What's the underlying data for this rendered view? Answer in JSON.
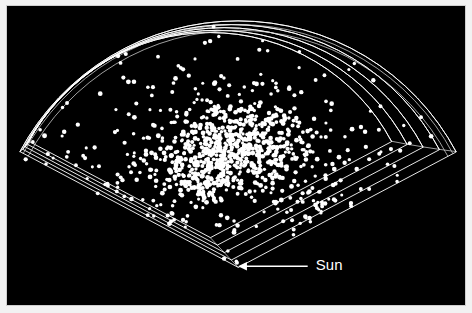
{
  "figure": {
    "kind": "redshift-survey-wedge-diagram",
    "background_color": "#000000",
    "page_background_color": "#f2f2f2",
    "border_color": "#cfcfcf",
    "ink_color": "#ffffff"
  },
  "annotation": {
    "label": "Sun",
    "arrow_direction": "left",
    "arrow_tip_x": 232,
    "arrow_tail_x": 302,
    "arrow_y": 262,
    "label_x": 310,
    "label_y": 262
  },
  "chart_data": {
    "type": "scatter",
    "title": "",
    "subtitle": "",
    "xlabel": "",
    "ylabel": "",
    "annotations": [
      "Sun"
    ],
    "legend": [],
    "grid": false,
    "projection": "polar-wedge",
    "geometry": {
      "apex": [
        232,
        263
      ],
      "radius_outer": 248,
      "radius_inner": 0,
      "angle_start_deg": -152,
      "angle_end_deg": -28,
      "layer_count": 5,
      "layer_offset_x": -7.0,
      "layer_offset_y": -7.5,
      "layer_scale_step": 0.955,
      "slab_depth_x": 9,
      "slab_depth_y": 5
    },
    "point_style": {
      "color": "#ffffff",
      "radius_px": 1.9,
      "count": 980
    },
    "density_model": {
      "note": "radial/angular density of plotted galaxies, peak in mid-radius band toward center-left of wedge",
      "radial_bins_frac": [
        0.1,
        0.2,
        0.3,
        0.4,
        0.5,
        0.6,
        0.7,
        0.8,
        0.9,
        1.0
      ],
      "radial_weights": [
        0.05,
        0.22,
        0.72,
        1.0,
        0.92,
        0.7,
        0.52,
        0.4,
        0.3,
        0.18
      ],
      "angular_bins_frac": [
        0.0,
        0.15,
        0.3,
        0.45,
        0.6,
        0.75,
        0.9,
        1.0
      ],
      "angular_weights": [
        0.3,
        0.55,
        0.95,
        1.0,
        0.85,
        0.62,
        0.45,
        0.32
      ],
      "clump_centers_frac": [
        [
          0.46,
          0.4
        ],
        [
          0.52,
          0.48
        ],
        [
          0.42,
          0.55
        ],
        [
          0.58,
          0.36
        ],
        [
          0.5,
          0.62
        ],
        [
          0.38,
          0.33
        ],
        [
          0.62,
          0.52
        ],
        [
          0.45,
          0.29
        ],
        [
          0.55,
          0.68
        ],
        [
          0.35,
          0.46
        ]
      ]
    }
  }
}
